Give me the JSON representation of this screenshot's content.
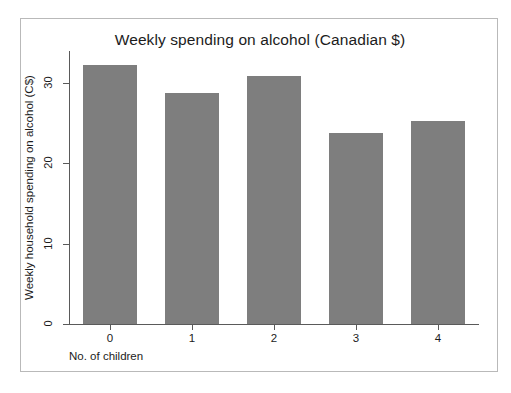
{
  "chart_data": {
    "type": "bar",
    "title": "Weekly spending on alcohol (Canadian $)",
    "xlabel": "No. of children",
    "ylabel": "Weekly household spending on alcohol (C$)",
    "categories": [
      "0",
      "1",
      "2",
      "3",
      "4"
    ],
    "values": [
      32.2,
      28.8,
      30.9,
      23.8,
      25.3
    ],
    "ylim": [
      0,
      34
    ],
    "xlim": [
      -0.5,
      4.5
    ],
    "yticks": [
      0,
      10,
      20,
      30
    ],
    "ytick_labels": [
      "0",
      "10",
      "20",
      "30"
    ],
    "xtick_labels": [
      "0",
      "1",
      "2",
      "3",
      "4"
    ],
    "grid": false,
    "legend": null,
    "bar_color": "#7e7e7e",
    "axis_color": "#5a5a5a",
    "background_color": "#ffffff",
    "border_color": "#b9b9b9"
  }
}
